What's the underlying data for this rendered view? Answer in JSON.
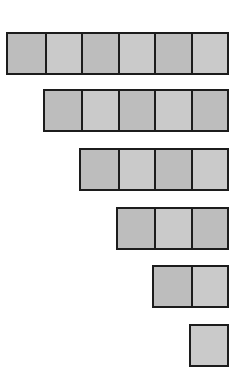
{
  "diagram": {
    "type": "staircase-of-squares",
    "rows": [
      {
        "count": 6,
        "top": 32,
        "shades": [
          "dark",
          "light",
          "dark",
          "light",
          "dark",
          "light"
        ]
      },
      {
        "count": 5,
        "top": 89,
        "shades": [
          "dark",
          "light",
          "dark",
          "light",
          "dark"
        ]
      },
      {
        "count": 4,
        "top": 148,
        "shades": [
          "dark",
          "light",
          "dark",
          "light"
        ]
      },
      {
        "count": 3,
        "top": 207,
        "shades": [
          "dark",
          "light",
          "dark"
        ]
      },
      {
        "count": 2,
        "top": 265,
        "shades": [
          "dark",
          "light"
        ]
      },
      {
        "count": 1,
        "top": 324,
        "shades": [
          "light"
        ]
      }
    ],
    "colors": {
      "dark": "#bdbdbd",
      "light": "#cacaca",
      "border": "#1c1c1c",
      "background": "#ffffff"
    }
  }
}
